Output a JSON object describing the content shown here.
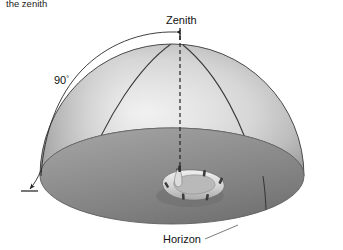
{
  "figure": {
    "kind": "celestial-hemisphere-diagram",
    "top_caption": "the zenith",
    "labels": {
      "zenith": "Zenith",
      "horizon": "Horizon",
      "angle": "90",
      "angle_unit": "°",
      "angle_full": "90°"
    },
    "annotations": {
      "zenith_pointer": "arrow-pointing-to-zenith-axis",
      "angle_arc": "arc-from-zenith-to-horizon",
      "horizon_leader": "leader-line-to-horizon-rim",
      "vertical_axis": "dashed-line-from-observer-to-zenith"
    },
    "objects": {
      "observer": "life-raft-observer",
      "dome": "sky-hemisphere",
      "ground": "horizon-plane-disc"
    },
    "colors": {
      "dome_light": "#e6e6e6",
      "dome_mid": "#cfcfcf",
      "dome_dark": "#8f8f8f",
      "ground_light": "#9a9a9a",
      "ground_dark": "#747474",
      "ink": "#1b1b1b",
      "line": "#2a2a2a",
      "background": "#ffffff"
    }
  }
}
